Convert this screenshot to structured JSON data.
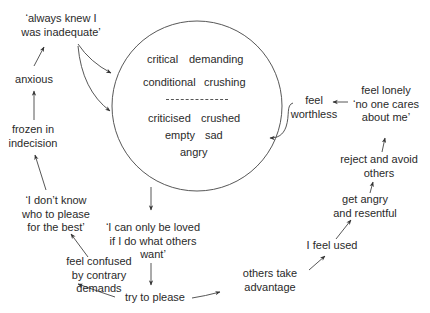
{
  "diagram": {
    "type": "cycle-diagram",
    "center_circle": {
      "upper_words": [
        "critical",
        "demanding",
        "conditional",
        "crushing"
      ],
      "separator": "--------------",
      "lower_words": [
        "criticised",
        "crushed",
        "empty",
        "sad",
        "angry"
      ]
    },
    "nodes": {
      "always_knew": [
        "‘always knew I",
        "was inadequate’"
      ],
      "anxious": [
        "anxious"
      ],
      "frozen": [
        "frozen in",
        "indecision"
      ],
      "dont_know": [
        "‘I don’t know",
        "who to please",
        "for the best’"
      ],
      "confused": [
        "feel confused",
        "by contrary",
        "demands"
      ],
      "only_loved": [
        "‘I can only be loved",
        "if I do what others",
        "want’"
      ],
      "try_please": [
        "try to please"
      ],
      "take_adv": [
        "others take",
        "advantage"
      ],
      "feel_used": [
        "I feel used"
      ],
      "angry_resentful": [
        "get angry",
        "and resentful"
      ],
      "reject_avoid": [
        "reject and avoid",
        "others"
      ],
      "lonely": [
        "feel lonely",
        "‘no one cares",
        "about me’"
      ],
      "worthless": [
        "feel",
        "worthless"
      ]
    },
    "edges": [
      [
        "always_knew",
        "center_circle"
      ],
      [
        "always_knew",
        "center_circle"
      ],
      [
        "center_circle",
        "only_loved"
      ],
      [
        "only_loved",
        "try_please"
      ],
      [
        "try_please",
        "confused"
      ],
      [
        "try_please",
        "take_adv"
      ],
      [
        "take_adv",
        "feel_used"
      ],
      [
        "feel_used",
        "angry_resentful"
      ],
      [
        "angry_resentful",
        "reject_avoid"
      ],
      [
        "reject_avoid",
        "lonely"
      ],
      [
        "lonely",
        "worthless"
      ],
      [
        "worthless",
        "center_circle"
      ],
      [
        "confused",
        "dont_know"
      ],
      [
        "dont_know",
        "frozen"
      ],
      [
        "frozen",
        "anxious"
      ],
      [
        "anxious",
        "always_knew"
      ]
    ],
    "colors": {
      "line": "#333333",
      "text": "#2a2a2a",
      "background": "#ffffff"
    }
  }
}
